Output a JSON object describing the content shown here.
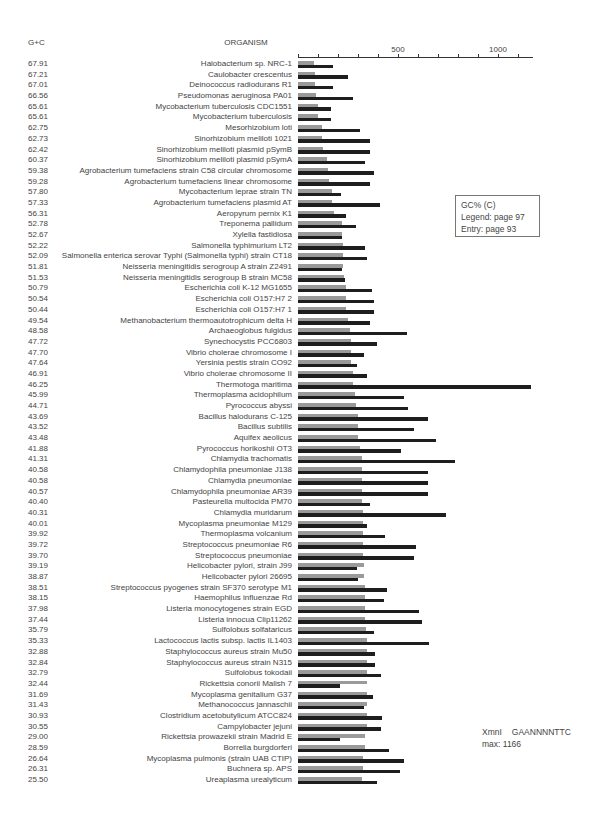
{
  "header": {
    "gc_label": "G+C",
    "organism_label": "ORGANISM"
  },
  "axis": {
    "ticks": [
      0,
      100,
      200,
      300,
      400,
      500,
      600,
      700,
      800,
      900,
      1000,
      1100
    ],
    "labels": [
      {
        "value": 500,
        "text": "500"
      },
      {
        "value": 1000,
        "text": "1000"
      }
    ],
    "px_per_unit": 0.2,
    "max_px": 235
  },
  "colors": {
    "gray_bar": "#9a9a9a",
    "black_bar": "#1e1e1e"
  },
  "legend": {
    "line1": "GC% (C)",
    "line2": "Legend: page 97",
    "line3": "Entry: page 93"
  },
  "note": {
    "enzyme": "XmnI",
    "site": "GAANNNNTTC",
    "max": "max: 1166"
  },
  "chart_data": {
    "type": "bar",
    "orientation": "horizontal",
    "title": "",
    "xlabel": "",
    "ylabel": "ORGANISM",
    "xlim": [
      0,
      1166
    ],
    "grid": false,
    "legend_position": "right box",
    "series": [
      {
        "name": "GC% (expected, gray)",
        "color": "#9a9a9a"
      },
      {
        "name": "XmnI site count (black)",
        "color": "#1e1e1e"
      }
    ],
    "rows": [
      {
        "gc": "67.91",
        "organism": "Halobacterium sp. NRC-1",
        "gray": 80,
        "black": 175
      },
      {
        "gc": "67.21",
        "organism": "Caulobacter crescentus",
        "gray": 85,
        "black": 250
      },
      {
        "gc": "67.01",
        "organism": "Deinococcus radiodurans R1",
        "gray": 85,
        "black": 175
      },
      {
        "gc": "66.56",
        "organism": "Pseudomonas aeruginosa PA01",
        "gray": 90,
        "black": 275
      },
      {
        "gc": "65.61",
        "organism": "Mycobacterium tuberculosis CDC1551",
        "gray": 100,
        "black": 165
      },
      {
        "gc": "65.61",
        "organism": "Mycobacterium tuberculosis",
        "gray": 100,
        "black": 165
      },
      {
        "gc": "62.75",
        "organism": "Mesorhizobium loti",
        "gray": 120,
        "black": 310
      },
      {
        "gc": "62.73",
        "organism": "Sinorhizobium meliloti 1021",
        "gray": 120,
        "black": 360
      },
      {
        "gc": "62.42",
        "organism": "Sinorhizobium meliloti plasmid pSymB",
        "gray": 125,
        "black": 360
      },
      {
        "gc": "60.37",
        "organism": "Sinorhizobium meliloti plasmid pSymA",
        "gray": 145,
        "black": 335
      },
      {
        "gc": "59.38",
        "organism": "Agrobacterium tumefaciens strain C58 circular chromosome",
        "gray": 150,
        "black": 380
      },
      {
        "gc": "59.28",
        "organism": "Agrobacterium tumefaciens linear chromosome",
        "gray": 155,
        "black": 360
      },
      {
        "gc": "57.80",
        "organism": "Mycobacterium leprae strain TN",
        "gray": 170,
        "black": 215
      },
      {
        "gc": "57.33",
        "organism": "Agrobacterium tumefaciens plasmid AT",
        "gray": 170,
        "black": 410
      },
      {
        "gc": "56.31",
        "organism": "Aeropyrum pernix K1",
        "gray": 180,
        "black": 240
      },
      {
        "gc": "52.78",
        "organism": "Treponema pallidum",
        "gray": 220,
        "black": 290
      },
      {
        "gc": "52.67",
        "organism": "Xylella fastidiosa",
        "gray": 220,
        "black": 220
      },
      {
        "gc": "52.22",
        "organism": "Salmonella typhimurium LT2",
        "gray": 225,
        "black": 335
      },
      {
        "gc": "52.09",
        "organism": "Salmonella enterica serovar Typhi (Salmonella typhi) strain CT18",
        "gray": 225,
        "black": 345
      },
      {
        "gc": "51.81",
        "organism": "Neisseria meningitidis serogroup A strain Z2491",
        "gray": 225,
        "black": 220
      },
      {
        "gc": "51.53",
        "organism": "Neisseria meningitidis serogroup B strain MC58",
        "gray": 230,
        "black": 235
      },
      {
        "gc": "50.79",
        "organism": "Escherichia coli K-12 MG1655",
        "gray": 240,
        "black": 370
      },
      {
        "gc": "50.54",
        "organism": "Escherichia coli O157:H7 2",
        "gray": 240,
        "black": 380
      },
      {
        "gc": "50.44",
        "organism": "Escherichia coli O157:H7 1",
        "gray": 240,
        "black": 380
      },
      {
        "gc": "49.54",
        "organism": "Methanobacterium thermoautotrophicum delta H",
        "gray": 250,
        "black": 360
      },
      {
        "gc": "48.58",
        "organism": "Archaeoglobus fulgidus",
        "gray": 260,
        "black": 545
      },
      {
        "gc": "47.72",
        "organism": "Synechocystis PCC6803",
        "gray": 265,
        "black": 395
      },
      {
        "gc": "47.70",
        "organism": "Vibrio cholerae chromosome I",
        "gray": 265,
        "black": 330
      },
      {
        "gc": "47.64",
        "organism": "Yersinia pestis strain CO92",
        "gray": 265,
        "black": 295
      },
      {
        "gc": "46.91",
        "organism": "Vibrio cholerae chromosome II",
        "gray": 275,
        "black": 345
      },
      {
        "gc": "46.25",
        "organism": "Thermotoga maritima",
        "gray": 275,
        "black": 1166
      },
      {
        "gc": "45.99",
        "organism": "Thermoplasma acidophilum",
        "gray": 285,
        "black": 530
      },
      {
        "gc": "44.71",
        "organism": "Pyrococcus abyssi",
        "gray": 290,
        "black": 550
      },
      {
        "gc": "43.69",
        "organism": "Bacillus halodurans C-125",
        "gray": 300,
        "black": 650
      },
      {
        "gc": "43.52",
        "organism": "Bacillus subtilis",
        "gray": 300,
        "black": 580
      },
      {
        "gc": "43.48",
        "organism": "Aquifex aeolicus",
        "gray": 300,
        "black": 690
      },
      {
        "gc": "41.88",
        "organism": "Pyrococcus horikoshii OT3",
        "gray": 310,
        "black": 515
      },
      {
        "gc": "41.31",
        "organism": "Chlamydia trachomatis",
        "gray": 320,
        "black": 785
      },
      {
        "gc": "40.58",
        "organism": "Chlamydophila pneumoniae J138",
        "gray": 320,
        "black": 650
      },
      {
        "gc": "40.58",
        "organism": "Chlamydia pneumoniae",
        "gray": 320,
        "black": 650
      },
      {
        "gc": "40.57",
        "organism": "Chlamydophila pneumoniae AR39",
        "gray": 320,
        "black": 650
      },
      {
        "gc": "40.40",
        "organism": "Pasteurella multocida PM70",
        "gray": 320,
        "black": 360
      },
      {
        "gc": "40.31",
        "organism": "Chlamydia muridarum",
        "gray": 325,
        "black": 740
      },
      {
        "gc": "40.01",
        "organism": "Mycoplasma pneumoniae M129",
        "gray": 325,
        "black": 345
      },
      {
        "gc": "39.92",
        "organism": "Thermoplasma volcanium",
        "gray": 325,
        "black": 435
      },
      {
        "gc": "39.72",
        "organism": "Streptococcus pneumoniae R6",
        "gray": 325,
        "black": 590
      },
      {
        "gc": "39.70",
        "organism": "Streptococcus pneumoniae",
        "gray": 325,
        "black": 580
      },
      {
        "gc": "39.19",
        "organism": "Helicobacter pylori, strain J99",
        "gray": 330,
        "black": 295
      },
      {
        "gc": "38.87",
        "organism": "Helicobacter pylori 26695",
        "gray": 330,
        "black": 300
      },
      {
        "gc": "38.51",
        "organism": "Streptococcus pyogenes strain SF370 serotype M1",
        "gray": 335,
        "black": 445
      },
      {
        "gc": "38.15",
        "organism": "Haemophilus influenzae Rd",
        "gray": 335,
        "black": 430
      },
      {
        "gc": "37.98",
        "organism": "Listeria monocytogenes strain EGD",
        "gray": 335,
        "black": 605
      },
      {
        "gc": "37.44",
        "organism": "Listeria innocua Clip11262",
        "gray": 335,
        "black": 620
      },
      {
        "gc": "35.79",
        "organism": "Sulfolobus solfataricus",
        "gray": 340,
        "black": 380
      },
      {
        "gc": "35.33",
        "organism": "Lactococcus lactis subsp. lactis IL1403",
        "gray": 345,
        "black": 655
      },
      {
        "gc": "32.88",
        "organism": "Staphylococcus aureus strain Mu50",
        "gray": 345,
        "black": 385
      },
      {
        "gc": "32.84",
        "organism": "Staphylococcus aureus strain N315",
        "gray": 345,
        "black": 385
      },
      {
        "gc": "32.79",
        "organism": "Sulfolobus tokodaii",
        "gray": 345,
        "black": 415
      },
      {
        "gc": "32.44",
        "organism": "Rickettsia conorii Malish 7",
        "gray": 345,
        "black": 210
      },
      {
        "gc": "31.69",
        "organism": "Mycoplasma genitalium G37",
        "gray": 345,
        "black": 375
      },
      {
        "gc": "31.43",
        "organism": "Methanococcus jannaschii",
        "gray": 345,
        "black": 330
      },
      {
        "gc": "30.93",
        "organism": "Clostridium acetobutylicum ATCC824",
        "gray": 345,
        "black": 420
      },
      {
        "gc": "30.55",
        "organism": "Campylobacter jejuni",
        "gray": 345,
        "black": 415
      },
      {
        "gc": "29.00",
        "organism": "Rickettsia prowazekii strain Madrid E",
        "gray": 335,
        "black": 210
      },
      {
        "gc": "28.59",
        "organism": "Borrelia burgdorferi",
        "gray": 335,
        "black": 455
      },
      {
        "gc": "26.64",
        "organism": "Mycoplasma pulmonis (strain UAB CTIP)",
        "gray": 325,
        "black": 530
      },
      {
        "gc": "26.31",
        "organism": "Buchnera sp. APS",
        "gray": 325,
        "black": 510
      },
      {
        "gc": "25.50",
        "organism": "Ureaplasma urealyticum",
        "gray": 320,
        "black": 395
      }
    ]
  }
}
